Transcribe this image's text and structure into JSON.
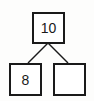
{
  "diagram": {
    "type": "number-bond",
    "whole": "10",
    "parts": [
      "8",
      ""
    ]
  }
}
